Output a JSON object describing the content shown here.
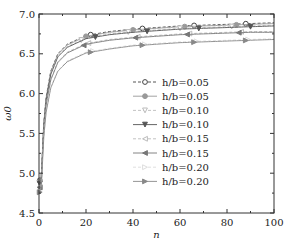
{
  "chart_data": {
    "type": "line",
    "title": "",
    "xlabel": "n",
    "ylabel": "ω0",
    "xlim": [
      0,
      100
    ],
    "ylim": [
      4.5,
      7.0
    ],
    "xticks": [
      0,
      20,
      40,
      60,
      80,
      100
    ],
    "xtick_labels": [
      "0",
      "20",
      "40",
      "60",
      "80",
      "100"
    ],
    "yticks": [
      4.5,
      5.0,
      5.5,
      6.0,
      6.5,
      7.0
    ],
    "ytick_labels": [
      "4.5",
      "5.0",
      "5.5",
      "6.0",
      "6.5",
      "7.0"
    ],
    "grid": false,
    "legend_position": "center-right",
    "x": [
      1,
      2,
      3,
      5,
      8,
      12,
      20,
      30,
      40,
      50,
      60,
      70,
      80,
      90,
      100
    ],
    "series": [
      {
        "name": "h/b=0.05",
        "label": "h/b=0.05",
        "line": "dashed",
        "marker": "circle-open",
        "color": "#444444",
        "values": [
          4.98,
          5.62,
          5.95,
          6.28,
          6.5,
          6.62,
          6.73,
          6.78,
          6.81,
          6.83,
          6.85,
          6.86,
          6.87,
          6.88,
          6.89
        ]
      },
      {
        "name": "h/b=0.05 (solid)",
        "label": "h/b=0.05",
        "line": "solid",
        "marker": "circle-filled",
        "color": "#999999",
        "values": [
          4.97,
          5.61,
          5.94,
          6.27,
          6.49,
          6.61,
          6.72,
          6.77,
          6.8,
          6.82,
          6.84,
          6.85,
          6.86,
          6.87,
          6.88
        ]
      },
      {
        "name": "h/b=0.10",
        "label": "h/b=0.10",
        "line": "dashed",
        "marker": "triangle-down-open",
        "color": "#bbbbbb",
        "values": [
          4.95,
          5.59,
          5.92,
          6.25,
          6.47,
          6.59,
          6.7,
          6.75,
          6.78,
          6.8,
          6.82,
          6.83,
          6.84,
          6.85,
          6.86
        ]
      },
      {
        "name": "h/b=0.10 (solid)",
        "label": "h/b=0.10",
        "line": "solid",
        "marker": "triangle-down-filled",
        "color": "#555555",
        "values": [
          4.94,
          5.58,
          5.91,
          6.24,
          6.46,
          6.58,
          6.69,
          6.74,
          6.77,
          6.79,
          6.81,
          6.82,
          6.83,
          6.84,
          6.85
        ]
      },
      {
        "name": "h/b=0.15",
        "label": "h/b=0.15",
        "line": "dashed",
        "marker": "triangle-left-open",
        "color": "#bbbbbb",
        "values": [
          4.9,
          5.53,
          5.86,
          6.18,
          6.4,
          6.52,
          6.63,
          6.68,
          6.71,
          6.73,
          6.75,
          6.76,
          6.77,
          6.78,
          6.78
        ]
      },
      {
        "name": "h/b=0.15 (solid)",
        "label": "h/b=0.15",
        "line": "solid",
        "marker": "triangle-left-filled",
        "color": "#777777",
        "values": [
          4.89,
          5.52,
          5.85,
          6.17,
          6.39,
          6.51,
          6.62,
          6.67,
          6.7,
          6.72,
          6.74,
          6.75,
          6.76,
          6.77,
          6.77
        ]
      },
      {
        "name": "h/b=0.20",
        "label": "h/b=0.20",
        "line": "dashed",
        "marker": "triangle-right-open",
        "color": "#dddddd",
        "values": [
          4.84,
          5.45,
          5.77,
          6.08,
          6.29,
          6.41,
          6.52,
          6.57,
          6.61,
          6.63,
          6.65,
          6.66,
          6.67,
          6.68,
          6.69
        ]
      },
      {
        "name": "h/b=0.20 (solid)",
        "label": "h/b=0.20",
        "line": "solid",
        "marker": "triangle-right-filled",
        "color": "#888888",
        "values": [
          4.83,
          5.44,
          5.76,
          6.07,
          6.28,
          6.4,
          6.51,
          6.56,
          6.6,
          6.62,
          6.64,
          6.65,
          6.66,
          6.67,
          6.68
        ]
      }
    ],
    "marker_positions": [
      [
        22,
        44,
        66,
        88
      ],
      [
        20,
        40,
        62,
        84
      ],
      [
        18,
        38,
        60,
        82
      ],
      [
        24,
        46,
        68,
        90
      ],
      [
        21,
        42,
        64,
        86
      ],
      [
        19,
        41,
        63,
        85
      ],
      [
        23,
        45,
        67,
        89
      ],
      [
        22,
        44,
        66,
        88
      ]
    ]
  }
}
